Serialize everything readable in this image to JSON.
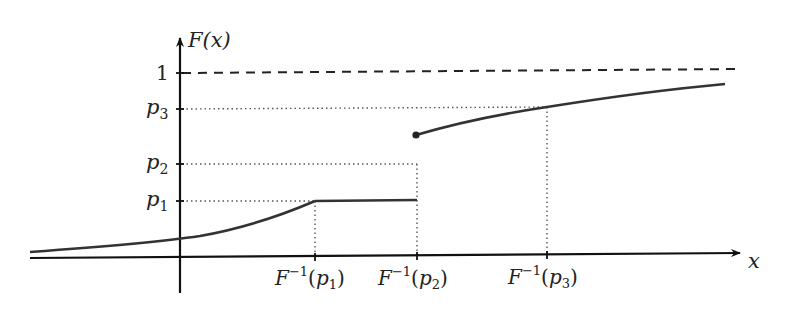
{
  "figure": {
    "y_axis_label": "F(x)",
    "x_axis_label": "x",
    "y_ticks": {
      "one": "1",
      "p3": {
        "base": "p",
        "sub": "3"
      },
      "p2": {
        "base": "p",
        "sub": "2"
      },
      "p1": {
        "base": "p",
        "sub": "1"
      }
    },
    "x_ticks": [
      {
        "base": "F",
        "sup": "−1",
        "arg": "p",
        "sub": "1"
      },
      {
        "base": "F",
        "sup": "−1",
        "arg": "p",
        "sub": "2"
      },
      {
        "base": "F",
        "sup": "−1",
        "arg": "p",
        "sub": "3"
      }
    ],
    "colors": {
      "curve": "#333333",
      "axis": "#111111",
      "guide": "#555555"
    }
  }
}
